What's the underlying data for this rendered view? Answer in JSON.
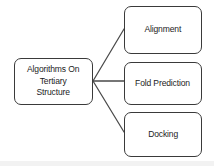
{
  "diagram": {
    "type": "flowchart",
    "orientation": "left-to-right",
    "background_color": "#ffffff",
    "box_border_color": "#3a3a3a",
    "connector_color": "#4a4a4a",
    "text_color": "#1c1c1c",
    "root": {
      "id": "algorithms-on-tertiary-structure",
      "label": "Algorithms On\nTertiary\nStructure",
      "lines": [
        "Algorithms On",
        "Tertiary",
        "Structure"
      ]
    },
    "children": [
      {
        "id": "alignment",
        "label": "Alignment",
        "connector": "diagonal-up"
      },
      {
        "id": "fold-prediction",
        "label": "Fold Prediction",
        "connector": "horizontal"
      },
      {
        "id": "docking",
        "label": "Docking",
        "connector": "diagonal-down"
      }
    ]
  }
}
